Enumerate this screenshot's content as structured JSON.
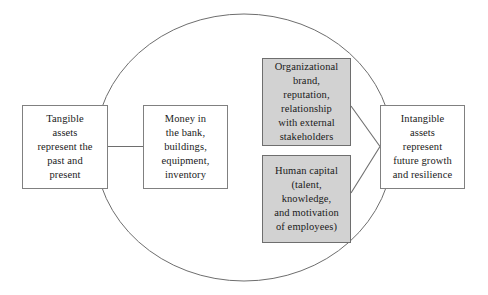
{
  "diagram": {
    "type": "concept-diagram",
    "background_color": "#ffffff",
    "boundary": {
      "shape": "ellipse",
      "stroke_color": "#6e6e6e"
    },
    "nodes": [
      {
        "id": "tangible-assets",
        "label": "Tangible\nassets\nrepresent the\npast and\npresent",
        "style": "plain",
        "fill": "#ffffff",
        "stroke": "#808080"
      },
      {
        "id": "money",
        "label": "Money in\nthe bank,\nbuildings,\nequipment,\ninventory",
        "style": "plain",
        "fill": "#ffffff",
        "stroke": "#808080"
      },
      {
        "id": "organizational-brand",
        "label": "Organizational\nbrand,\nreputation,\nrelationship\nwith external\nstakeholders",
        "style": "shaded",
        "fill": "#d2d2d2",
        "stroke": "#6e6e6e"
      },
      {
        "id": "human-capital",
        "label": "Human capital\n(talent,\nknowledge,\nand motivation\nof employees)",
        "style": "shaded",
        "fill": "#d2d2d2",
        "stroke": "#6e6e6e"
      },
      {
        "id": "intangible-assets",
        "label": "Intangible\nassets\nrepresent\nfuture growth\nand resilience",
        "style": "plain",
        "fill": "#ffffff",
        "stroke": "#808080"
      }
    ],
    "connectors": [
      {
        "id": "tangible-to-money",
        "from": "tangible-assets",
        "to": "money",
        "kind": "straight"
      },
      {
        "id": "brand-to-intangible",
        "from": "organizational-brand",
        "to": "intangible-assets",
        "kind": "diagonal"
      },
      {
        "id": "human-capital-to-intangible",
        "from": "human-capital",
        "to": "intangible-assets",
        "kind": "diagonal"
      }
    ]
  }
}
